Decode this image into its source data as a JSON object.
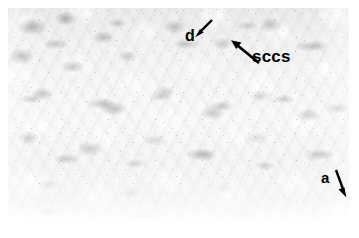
{
  "figure": {
    "type": "light-microscopy-micrograph",
    "tone": {
      "background_page": "#ffffff",
      "plate_light": "#fafafa",
      "plate_mid": "#e9e9ea",
      "plate_dark": "#6e7074",
      "annotation_ink": "#000000"
    },
    "plate": {
      "left": 8,
      "top": 8,
      "width": 341,
      "height": 210
    }
  },
  "annotations": [
    {
      "id": "d",
      "label": "d",
      "role": "structure-label",
      "label_position": {
        "x": 185,
        "y": 28
      },
      "arrow": {
        "tail": {
          "x": 212,
          "y": 20
        },
        "head": {
          "x": 197,
          "y": 35
        },
        "direction": "down-left"
      }
    },
    {
      "id": "sccs",
      "label": "sccs",
      "role": "structure-label",
      "label_position": {
        "x": 252,
        "y": 48
      },
      "arrow": {
        "tail": {
          "x": 259,
          "y": 63
        },
        "head": {
          "x": 232,
          "y": 41
        },
        "direction": "up-left"
      }
    },
    {
      "id": "a",
      "label": "a",
      "role": "structure-label",
      "label_position": {
        "x": 321,
        "y": 170
      },
      "arrow": {
        "tail": {
          "x": 336,
          "y": 170
        },
        "head": {
          "x": 346,
          "y": 197
        },
        "direction": "down-right"
      }
    }
  ]
}
